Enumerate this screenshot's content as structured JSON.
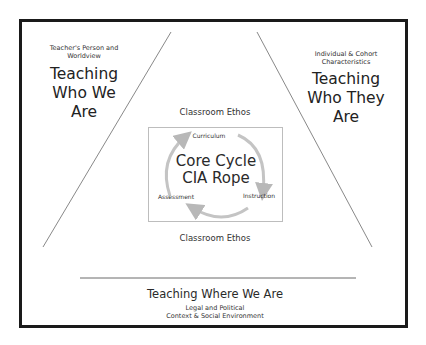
{
  "left_section": {
    "subtitle": "Teacher's Person and Worldview",
    "title_lines": [
      "Teaching",
      "Who We",
      "Are"
    ]
  },
  "right_section": {
    "subtitle_lines": [
      "Individual & Cohort",
      "Characteristics"
    ],
    "title_lines": [
      "Teaching",
      "Who They",
      "Are"
    ]
  },
  "center": {
    "ethos_top": "Classroom Ethos",
    "ethos_bottom": "Classroom Ethos",
    "core_lines": [
      "Core Cycle",
      "CIA Rope"
    ],
    "cycle_labels": {
      "curriculum": "Curriculum",
      "instruction": "Instruction",
      "assessment": "Assessment"
    }
  },
  "bottom_section": {
    "title": "Teaching Where We Are",
    "subtitle_lines": [
      "Legal and Political",
      "Context & Social Environment"
    ]
  },
  "colors": {
    "frame": "#1a1a1a",
    "lines": "#7a7a7a",
    "arrows": "#b8b8b8",
    "inner_box_border": "#bdbdbd"
  }
}
